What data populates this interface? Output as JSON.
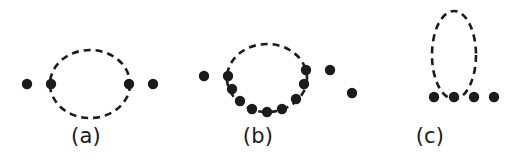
{
  "figure": {
    "width": 516,
    "height": 165,
    "background_color": "#ffffff",
    "ink_color": "#1b1b1b",
    "dot_color": "#1b1b1b",
    "line_style": "dashed",
    "dash_pattern": "7 5",
    "stroke_width": 2.6,
    "dot_radius": 5.2
  },
  "panels": [
    {
      "id": "a",
      "label": "(a)",
      "description": "dashed circular loop with two dots on each side on a horizontal line",
      "loop": {
        "shape": "circle",
        "cx": 90,
        "cy": 84,
        "rx": 40,
        "ry": 34
      },
      "dots": [
        {
          "name": "dot-a-left-outer",
          "cx": 27,
          "cy": 84
        },
        {
          "name": "dot-a-left-inner",
          "cx": 51,
          "cy": 84
        },
        {
          "name": "dot-a-right-inner",
          "cx": 129,
          "cy": 84
        },
        {
          "name": "dot-a-right-outer",
          "cx": 153,
          "cy": 84
        }
      ],
      "dot_count": 4
    },
    {
      "id": "b",
      "label": "(b)",
      "description": "dashed circular loop with seven dots distributed along its lower arc plus two external dots on each side",
      "loop": {
        "shape": "circle",
        "cx": 95,
        "cy": 78,
        "rx": 40,
        "ry": 34
      },
      "dots": [
        {
          "name": "dot-b-left-outer",
          "cx": 32,
          "cy": 76
        },
        {
          "name": "dot-b-left-inner",
          "cx": 56,
          "cy": 76
        },
        {
          "name": "dot-b-arc-1",
          "cx": 60,
          "cy": 89
        },
        {
          "name": "dot-b-arc-2",
          "cx": 68,
          "cy": 101
        },
        {
          "name": "dot-b-arc-3",
          "cx": 80,
          "cy": 109
        },
        {
          "name": "dot-b-arc-4",
          "cx": 95,
          "cy": 112
        },
        {
          "name": "dot-b-arc-5",
          "cx": 110,
          "cy": 109
        },
        {
          "name": "dot-b-arc-6",
          "cx": 124,
          "cy": 99
        },
        {
          "name": "dot-b-arc-7",
          "cx": 132,
          "cy": 84
        },
        {
          "name": "dot-b-right-inner",
          "cx": 134,
          "cy": 70
        },
        {
          "name": "dot-b-right-outer",
          "cx": 158,
          "cy": 70
        }
      ],
      "dot_count": 11
    },
    {
      "id": "c",
      "label": "(c)",
      "description": "vertical dashed elliptical loop rising from a horizontal row of four dots, with one isolated dot to the far left",
      "loop": {
        "shape": "ellipse",
        "cx": 110,
        "cy": 55,
        "rx": 22,
        "ry": 44
      },
      "dots": [
        {
          "name": "dot-c-isolated",
          "cx": 8,
          "cy": 93
        },
        {
          "name": "dot-c-row-1",
          "cx": 90,
          "cy": 97
        },
        {
          "name": "dot-c-row-2",
          "cx": 110,
          "cy": 97
        },
        {
          "name": "dot-c-row-3",
          "cx": 130,
          "cy": 97
        },
        {
          "name": "dot-c-row-4",
          "cx": 150,
          "cy": 97
        }
      ],
      "dot_count": 5
    }
  ]
}
